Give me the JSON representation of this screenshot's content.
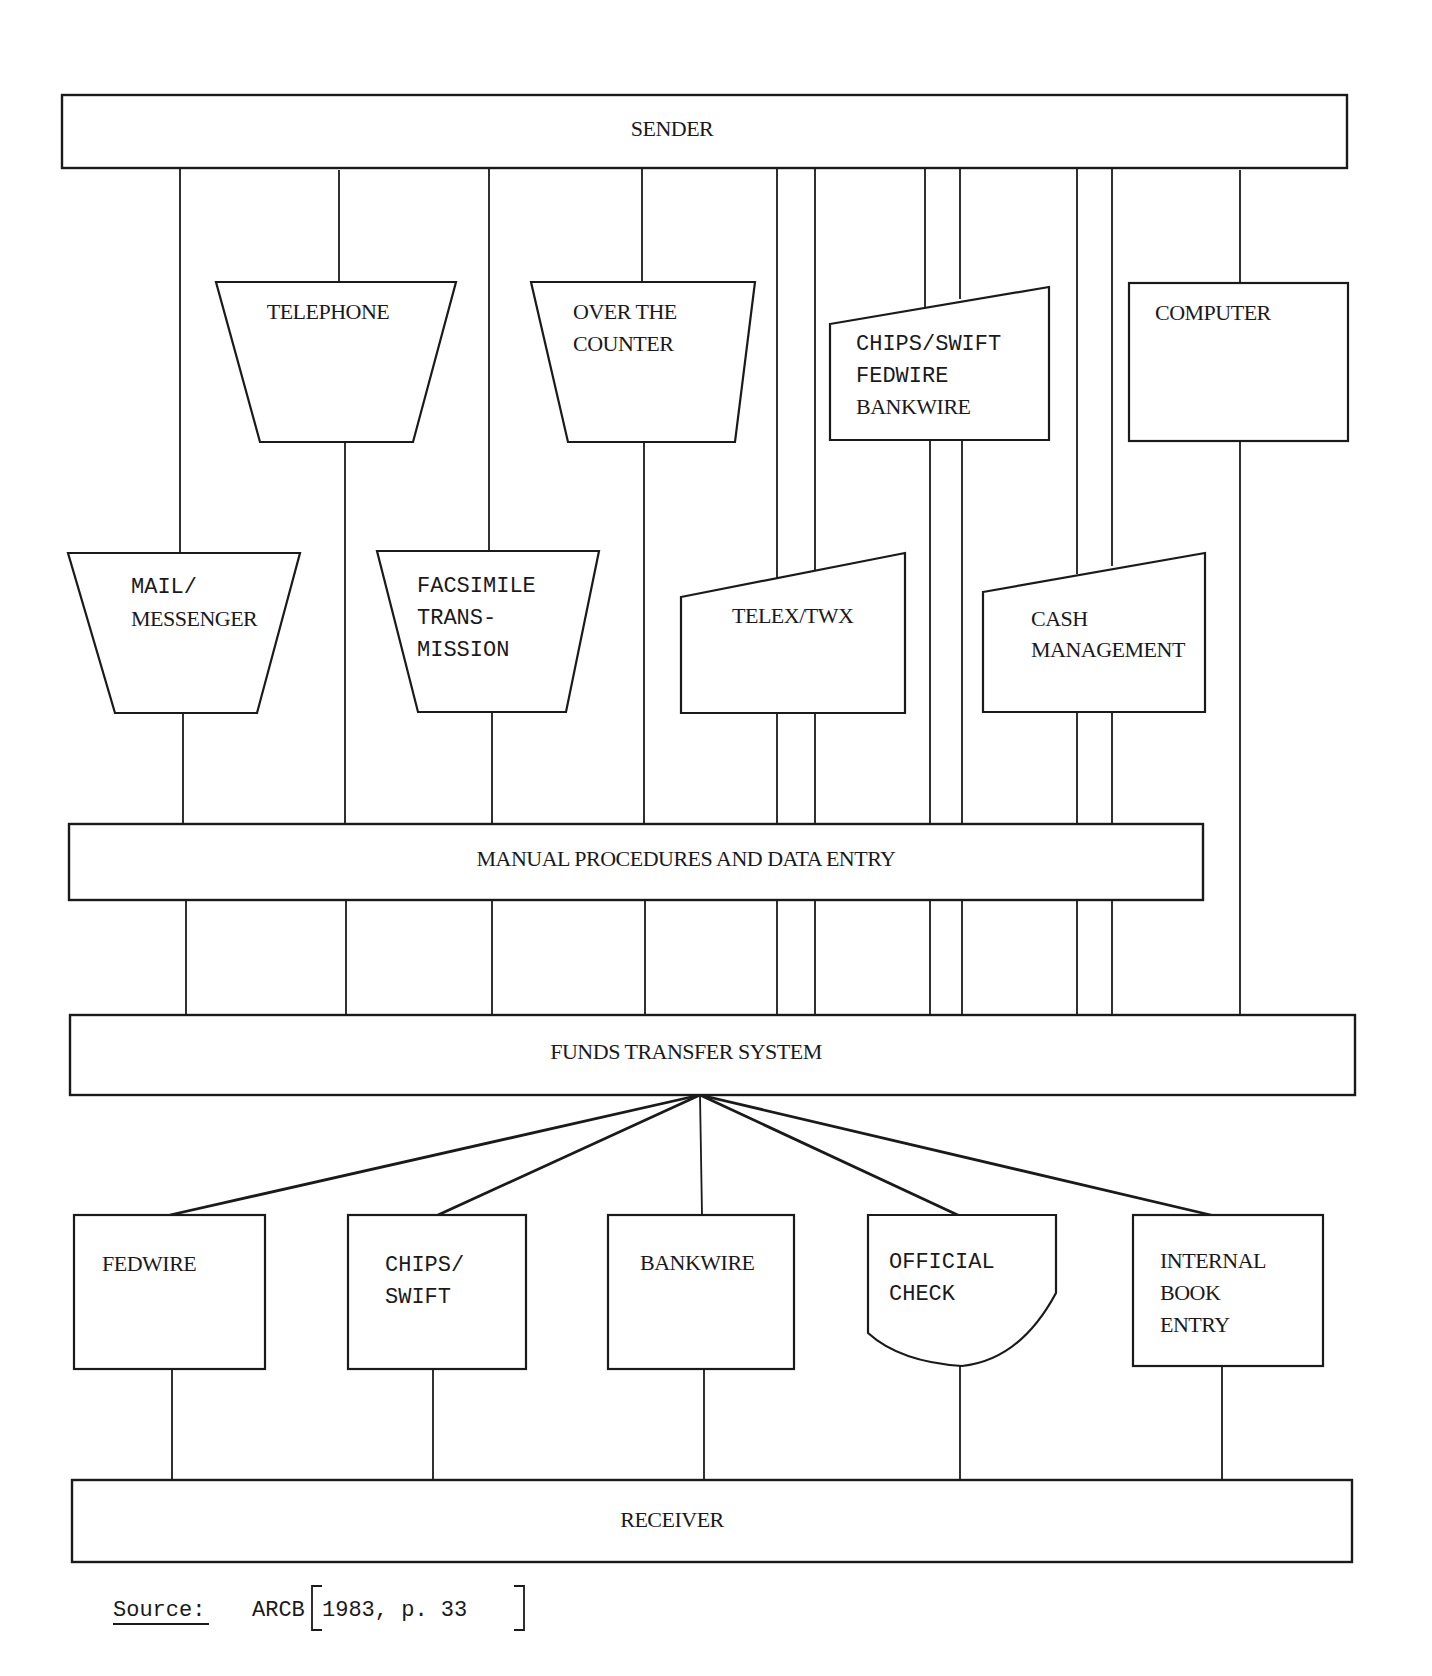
{
  "diagram": {
    "type": "flowchart",
    "colors": {
      "ink": "#1a1a1a",
      "paper": "#ffffff"
    }
  },
  "bars": {
    "sender": "SENDER",
    "manual": "MANUAL PROCEDURES AND DATA ENTRY",
    "fts": "FUNDS TRANSFER SYSTEM",
    "receiver": "RECEIVER"
  },
  "channels": {
    "telephone": {
      "lines": [
        "TELEPHONE"
      ]
    },
    "over_counter": {
      "lines": [
        "OVER THE",
        "COUNTER"
      ]
    },
    "chips_swift_fed_bank": {
      "lines": [
        "CHIPS/SWIFT",
        "FEDWIRE",
        "BANKWIRE"
      ]
    },
    "computer": {
      "lines": [
        "COMPUTER"
      ]
    },
    "mail": {
      "lines": [
        "MAIL/",
        "MESSENGER"
      ]
    },
    "facsimile": {
      "lines": [
        "FACSIMILE",
        "TRANS-",
        "MISSION"
      ]
    },
    "telex": {
      "lines": [
        "TELEX/TWX"
      ]
    },
    "cash_mgmt": {
      "lines": [
        "CASH",
        "MANAGEMENT"
      ]
    }
  },
  "outputs": {
    "fedwire": {
      "lines": [
        "FEDWIRE"
      ]
    },
    "chips_swift": {
      "lines": [
        "CHIPS/",
        "SWIFT"
      ]
    },
    "bankwire": {
      "lines": [
        "BANKWIRE"
      ]
    },
    "official_check": {
      "lines": [
        "OFFICIAL",
        "CHECK"
      ]
    },
    "internal_book": {
      "lines": [
        "INTERNAL",
        "BOOK",
        "ENTRY"
      ]
    }
  },
  "source": {
    "label": "Source:",
    "text": "ARCB",
    "citation": "1983, p. 33"
  }
}
